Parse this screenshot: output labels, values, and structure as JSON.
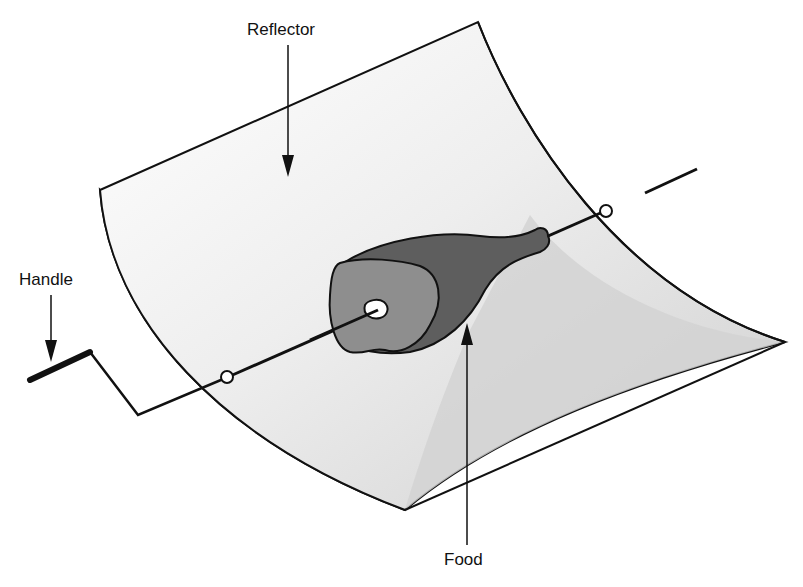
{
  "labels": {
    "reflector": "Reflector",
    "handle": "Handle",
    "food": "Food"
  },
  "colors": {
    "outline": "#111111",
    "side_shade": "#a9a9a9",
    "reflector_shade": "#d4d4d4",
    "reflector_light": "#f2f2f2",
    "food_dark": "#5e5e5e",
    "food_cut": "#8e8e8e"
  }
}
